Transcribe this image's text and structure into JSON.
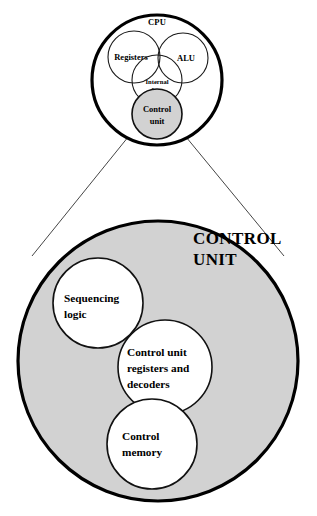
{
  "figure": {
    "background_color": "#ffffff",
    "shaded_fill": "#d2d2d2",
    "stroke_color": "#000000"
  },
  "cpu_overview": {
    "outer_label": "CPU",
    "parts": [
      {
        "id": "registers",
        "label": "Registers"
      },
      {
        "id": "alu",
        "label": "ALU"
      },
      {
        "id": "internal_bus",
        "label_line1": "Internal",
        "label_line2": "bus"
      },
      {
        "id": "control_unit",
        "label_line1": "Control",
        "label_line2": "unit"
      }
    ]
  },
  "control_unit_detail": {
    "title_line1": "CONTROL",
    "title_line2": "UNIT",
    "parts": [
      {
        "id": "sequencing-logic",
        "label_line1": "Sequencing",
        "label_line2": "logic",
        "label_line3": ""
      },
      {
        "id": "cu-registers-decoders",
        "label_line1": "Control unit",
        "label_line2": "registers and",
        "label_line3": "decoders"
      },
      {
        "id": "control-memory",
        "label_line1": "Control",
        "label_line2": "memory",
        "label_line3": ""
      }
    ]
  },
  "connectors": {
    "left_label": "zoom-line-left",
    "right_label": "zoom-line-right"
  }
}
